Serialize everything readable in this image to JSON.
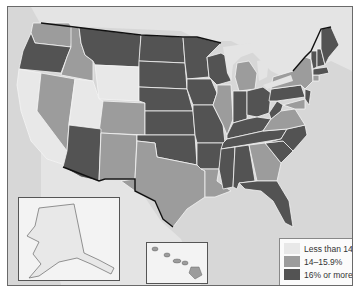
{
  "map": {
    "type": "choropleth",
    "region": "United States",
    "colors": {
      "ocean": "#d7d7d7",
      "land_foreign": "#e4e4e4",
      "low": "#e8e8e8",
      "mid": "#9c9c9c",
      "high": "#535353",
      "border": "#f4f4f4",
      "national_border": "#111111"
    },
    "legend": {
      "items": [
        {
          "label": "Less than 14%",
          "color": "#e8e8e8",
          "category": "low"
        },
        {
          "label": "14–15.9%",
          "color": "#9c9c9c",
          "category": "mid"
        },
        {
          "label": "16% or more",
          "color": "#535353",
          "category": "high"
        }
      ]
    },
    "states": {
      "low": [
        "California",
        "Utah",
        "Wyoming",
        "Alaska",
        "Hawaii"
      ],
      "mid": [
        "Washington",
        "Idaho",
        "Nevada",
        "Colorado",
        "New Mexico",
        "Texas",
        "Louisiana",
        "Illinois",
        "Michigan",
        "Georgia",
        "Virginia",
        "New York",
        "Maryland",
        "Delaware",
        "Connecticut"
      ],
      "high": [
        "Oregon",
        "Montana",
        "Arizona",
        "North Dakota",
        "South Dakota",
        "Nebraska",
        "Kansas",
        "Oklahoma",
        "Minnesota",
        "Iowa",
        "Missouri",
        "Arkansas",
        "Wisconsin",
        "Indiana",
        "Ohio",
        "Kentucky",
        "Tennessee",
        "Mississippi",
        "Alabama",
        "Florida",
        "South Carolina",
        "North Carolina",
        "West Virginia",
        "Pennsylvania",
        "New Jersey",
        "Maine",
        "Vermont",
        "New Hampshire",
        "Massachusetts",
        "Rhode Island"
      ]
    },
    "insets": [
      {
        "name": "Alaska",
        "category": "low"
      },
      {
        "name": "Hawaii",
        "category": "low"
      }
    ]
  }
}
